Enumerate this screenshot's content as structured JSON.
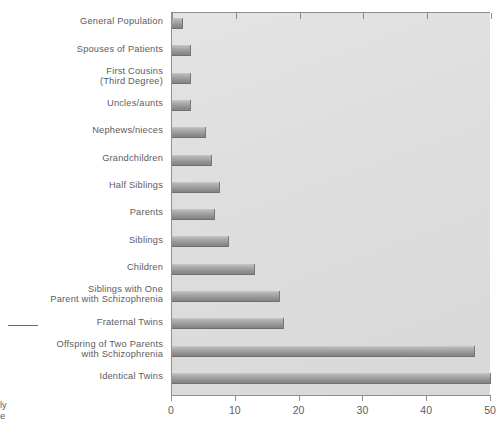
{
  "chart_data": {
    "type": "bar",
    "orientation": "horizontal",
    "title": "",
    "xlabel": "",
    "ylabel": "",
    "xlim": [
      0,
      50
    ],
    "xticks": [
      0,
      10,
      20,
      30,
      40,
      50
    ],
    "xtick_labels": [
      "0",
      "10",
      "20",
      "30",
      "40",
      "50"
    ],
    "grid": false,
    "legend": null,
    "categories": [
      "General Population",
      "Spouses of Patients",
      "First Cousins\n(Third Degree)",
      "Uncles/aunts",
      "Nephews/nieces",
      "Grandchildren",
      "Half Siblings",
      "Parents",
      "Siblings",
      "Children",
      "Siblings with One\nParent with Schizophrenia",
      "Fraternal Twins",
      "Offspring of Two Parents\nwith Schizophrenia",
      "Identical Twins"
    ],
    "values": [
      1.7,
      2.9,
      2.9,
      3.0,
      5.3,
      6.3,
      7.6,
      6.8,
      9.0,
      13.0,
      17.0,
      17.5,
      47.5,
      50.0
    ]
  },
  "axis": {
    "tick_labels": [
      "0",
      "10",
      "20",
      "30",
      "40",
      "50"
    ]
  },
  "cropped": {
    "bottom_left_fragment": "ly\ne",
    "top_fragment": ""
  }
}
